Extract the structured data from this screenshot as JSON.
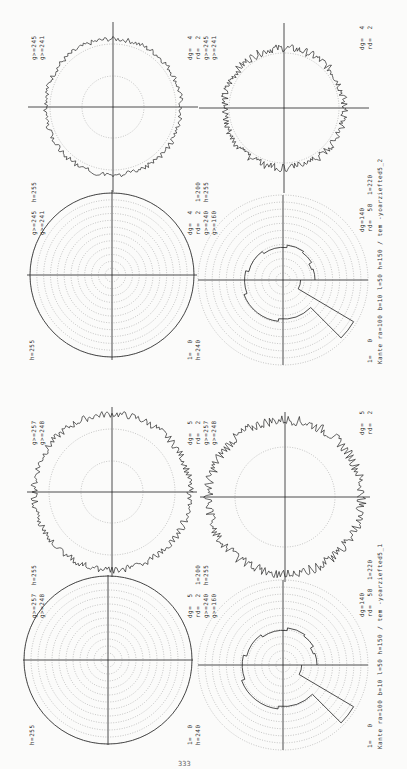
{
  "figures": [
    {
      "id": "yoarziefted5_2",
      "caption": "Kante ra=100 b=10 l=50 h=150 / tem -yoarziefted5_2",
      "plots": {
        "top_left": {
          "labels": [
            "g>=245",
            "g>=241"
          ],
          "type": "noisy-ring"
        },
        "top_left_br": {
          "labels": [
            "dg=  4",
            "rd=  2",
            "g>=245",
            "g>=241"
          ]
        },
        "top_right": {
          "labels": [
            "dg=  4",
            "rd=  2"
          ],
          "type": "noisy-ring"
        },
        "bottom_left": {
          "labels_top": [
            "g>=245  h=255",
            "g>=241"
          ],
          "labels_side": [
            "dg=  4",
            "rd=  2  1=200",
            "g>=240  h=255",
            "g>=160"
          ],
          "labels_bottom": [
            "h=255"
          ],
          "labels_bottom_right": [
            "1=  0",
            "h=240"
          ],
          "type": "concentric-rings"
        },
        "bottom_right": {
          "labels": [
            "dg=140",
            "rd=  58  1=220"
          ],
          "labels_bottom": [
            "1=   0"
          ],
          "type": "stepped-profile"
        }
      }
    },
    {
      "id": "yoarziefted5_1",
      "caption": "Kante ra=100 b=10 l=50 h=150 / tem -yoarziefted5_1",
      "plots": {
        "top_left": {
          "labels": [
            "g>=257",
            "g>=248"
          ],
          "type": "noisy-ring"
        },
        "top_left_br": {
          "labels": [
            "dg=  5",
            "rd=  2",
            "g>=257",
            "g>=248"
          ]
        },
        "top_right": {
          "labels": [
            "dg=  5",
            "rd=  2"
          ],
          "type": "noisy-ring"
        },
        "bottom_left": {
          "labels_top": [
            "g>=257  h=255",
            "g>=248"
          ],
          "labels_side": [
            "dg=  5",
            "rd=  2  1=200",
            "g>=240  h=255",
            "g>=160"
          ],
          "labels_bottom": [
            "h=255"
          ],
          "labels_bottom_right": [
            "1=  0",
            "h=240"
          ],
          "type": "concentric-rings"
        },
        "bottom_right": {
          "labels": [
            "dg=140",
            "rd=  58  1=220"
          ],
          "labels_bottom": [
            "1=   0"
          ],
          "type": "stepped-profile"
        }
      }
    }
  ],
  "page_number": "333"
}
